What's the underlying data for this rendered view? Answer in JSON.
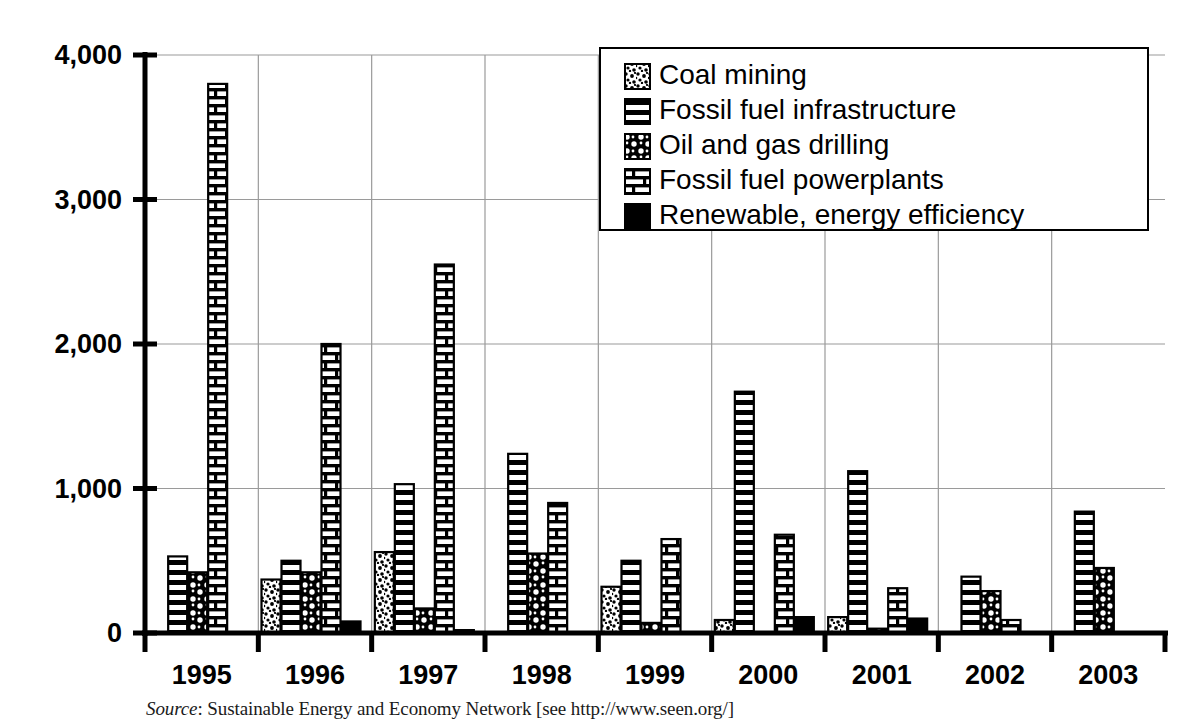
{
  "chart_data": {
    "type": "bar",
    "title": "",
    "subtitle": "",
    "xlabel": "",
    "ylabel": "",
    "categories": [
      "1995",
      "1996",
      "1997",
      "1998",
      "1999",
      "2000",
      "2001",
      "2002",
      "2003"
    ],
    "ylim": [
      0,
      4000
    ],
    "yticks": [
      0,
      1000,
      2000,
      3000,
      4000
    ],
    "ytick_labels": [
      "0",
      "1,000",
      "2,000",
      "3,000",
      "4,000"
    ],
    "grid": true,
    "legend_position": "top-right",
    "series": [
      {
        "name": "Coal mining",
        "pattern": "coal-mining-pattern",
        "values": [
          0,
          370,
          560,
          0,
          320,
          90,
          110,
          0,
          0
        ]
      },
      {
        "name": "Fossil fuel infrastructure",
        "pattern": "fossil-fuel-infrastructure-pattern",
        "values": [
          530,
          500,
          1030,
          1240,
          500,
          1670,
          1120,
          390,
          840
        ]
      },
      {
        "name": "Oil and gas drilling",
        "pattern": "oil-and-gas-drilling-pattern",
        "values": [
          420,
          420,
          170,
          550,
          70,
          0,
          30,
          290,
          450
        ]
      },
      {
        "name": "Fossil fuel powerplants",
        "pattern": "fossil-fuel-powerplants-pattern",
        "values": [
          3800,
          2000,
          2550,
          900,
          650,
          680,
          310,
          90,
          0
        ]
      },
      {
        "name": "Renewable, energy efficiency",
        "pattern": "renewable-energy-efficiency-pattern",
        "values": [
          0,
          80,
          20,
          0,
          0,
          110,
          100,
          0,
          0
        ]
      }
    ]
  },
  "legend": {
    "items": [
      {
        "label": "Coal mining",
        "swatch": "coal-mining-swatch"
      },
      {
        "label": "Fossil fuel infrastructure",
        "swatch": "fossil-fuel-infrastructure-swatch"
      },
      {
        "label": "Oil and gas drilling",
        "swatch": "oil-and-gas-drilling-swatch"
      },
      {
        "label": "Fossil fuel powerplants",
        "swatch": "fossil-fuel-powerplants-swatch"
      },
      {
        "label": "Renewable, energy efficiency",
        "swatch": "renewable-energy-efficiency-swatch"
      }
    ]
  },
  "source": {
    "prefix": "Source",
    "separator": ": ",
    "text": "Sustainable Energy and Economy Network [see http://www.seen.org/]",
    "full": "Source: Sustainable Energy and Economy Network [see http://www.seen.org/]"
  },
  "colors": {
    "ink": "#000000",
    "background": "#ffffff",
    "gridline": "#9a9a9a"
  }
}
